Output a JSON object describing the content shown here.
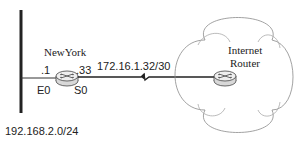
{
  "diagram": {
    "type": "network-topology",
    "lan": {
      "network": "192.168.2.0/24"
    },
    "router_local": {
      "name": "NewYork",
      "interfaces": [
        {
          "name": "E0",
          "address": ".1"
        },
        {
          "name": "S0",
          "address": ".33"
        }
      ]
    },
    "serial_link": {
      "network": "172.16.1.32/30"
    },
    "cloud": {
      "label_line1": "Internet",
      "label_line2": "Router"
    },
    "colors": {
      "line": "#222222",
      "cloud_stroke": "#888888",
      "router_stroke": "#444444",
      "router_fill": "#e6e6e6"
    }
  }
}
